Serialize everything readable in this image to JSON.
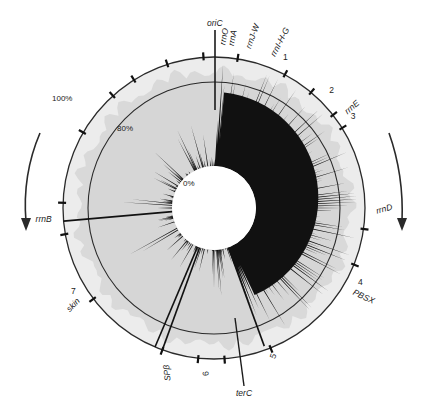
{
  "figure": {
    "type": "circular-genome-map",
    "center": {
      "x": 214,
      "y": 208
    },
    "radii": {
      "outer": 151,
      "ring80": 126,
      "inner": 42
    },
    "colors": {
      "background": "#ffffff",
      "ring_fill": "#d6d6d6",
      "outer_band": "#ececec",
      "spikes": "#111111",
      "line": "#2a2a2a",
      "hole": "#ffffff"
    },
    "scale_labels": [
      {
        "text": "100%",
        "x": 52,
        "y": 101
      },
      {
        "text": "80%",
        "x": 117,
        "y": 131
      },
      {
        "text": "0%",
        "x": 183,
        "y": 186
      }
    ],
    "origin_label": "oriC",
    "terminus_label": "terC",
    "markers": [
      {
        "text": "rrnO",
        "angle": 4,
        "rot": -80
      },
      {
        "text": "rrnA",
        "angle": 7,
        "rot": -80
      },
      {
        "text": "rrnJ-W",
        "angle": 13,
        "rot": -70
      },
      {
        "text": "rrnI-H-G",
        "angle": 22,
        "rot": -62
      },
      {
        "text": "1",
        "angle": 25,
        "rot": 0
      },
      {
        "text": "2",
        "angle": 45,
        "rot": 0
      },
      {
        "text": "rrnE",
        "angle": 55,
        "rot": -40
      },
      {
        "text": "3",
        "angle": 57,
        "rot": 0
      },
      {
        "text": "rrnD",
        "angle": 92,
        "rot": -15
      },
      {
        "text": "4",
        "angle": 118,
        "rot": 0
      },
      {
        "text": "PBSX",
        "angle": 122,
        "rot": 25
      },
      {
        "text": "5",
        "angle": 158,
        "rot": -70
      },
      {
        "text": "6",
        "angle": 182,
        "rot": -95
      },
      {
        "text": "SPβ",
        "angle": 196,
        "rot": -95
      },
      {
        "text": "skin",
        "angle": 235,
        "rot": -45
      },
      {
        "text": "7",
        "angle": 238,
        "rot": 0
      },
      {
        "text": "rrnB",
        "angle": 265,
        "rot": 0
      }
    ],
    "tick_angles": [
      -32,
      -18,
      -4,
      9,
      28,
      40,
      52,
      58,
      98,
      112,
      158,
      176,
      186,
      200,
      233,
      260,
      272,
      300,
      318
    ],
    "arrows": [
      {
        "name": "left-replication-arrow",
        "direction": "counterclockwise"
      },
      {
        "name": "right-replication-arrow",
        "direction": "clockwise"
      }
    ]
  }
}
